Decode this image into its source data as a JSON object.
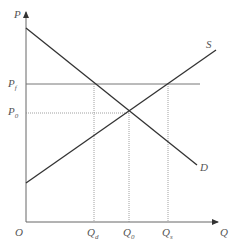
{
  "diagram": {
    "title": "",
    "axes": {
      "y_label": "P",
      "x_label": "Q",
      "origin_label": "O"
    },
    "curves": [
      {
        "name": "S",
        "label": "S",
        "description": "supply curve, upward sloping"
      },
      {
        "name": "D",
        "label": "D",
        "description": "demand curve, downward sloping"
      }
    ],
    "price_levels": [
      {
        "label": "P",
        "subscript": "f"
      },
      {
        "label": "P",
        "subscript": "0"
      }
    ],
    "quantity_levels": [
      {
        "label": "Q",
        "subscript": "d"
      },
      {
        "label": "Q",
        "subscript": "0"
      },
      {
        "label": "Q",
        "subscript": "s"
      }
    ],
    "colors": {
      "axis": "#555555",
      "curve": "#333333",
      "guide": "#888888"
    }
  }
}
